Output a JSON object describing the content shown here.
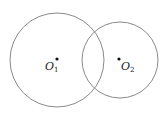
{
  "diagram": {
    "type": "intersecting-circles",
    "stroke_color": "#8a8a8a",
    "point_color": "#111111",
    "circles": [
      {
        "name": "O1",
        "label_main": "O",
        "label_sub": "1",
        "cx": 57,
        "cy": 60,
        "r": 47
      },
      {
        "name": "O2",
        "label_main": "O",
        "label_sub": "2",
        "cx": 120,
        "cy": 60,
        "r": 38
      }
    ]
  }
}
